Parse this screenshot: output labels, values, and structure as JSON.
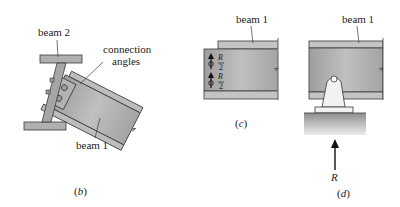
{
  "figure": {
    "panels": [
      {
        "id": "b",
        "caption": "(b)",
        "caption_letter": "b",
        "labels": {
          "beam2": "beam 2",
          "connection_angles_line1": "connection",
          "connection_angles_line2": "angles",
          "beam1": "beam 1"
        }
      },
      {
        "id": "c",
        "caption": "(c)",
        "caption_letter": "c",
        "labels": {
          "beam1": "beam 1",
          "force_top": "R/2",
          "force_bottom": "R/2",
          "force_num": "R",
          "force_den": "2"
        }
      },
      {
        "id": "d",
        "caption": "(d)",
        "caption_letter": "d",
        "labels": {
          "beam1": "beam 1",
          "reaction": "R"
        }
      }
    ],
    "colors": {
      "steel_fill": "#a8a8a8",
      "steel_light": "#c4c4c4",
      "flange_fill": "#bdbdbd",
      "outline": "#3a3a3a",
      "support_fill": "#e8e8e8",
      "ground_top": "#9a9a9a",
      "ground_bottom": "#e6e6e6",
      "text": "#222222"
    }
  }
}
